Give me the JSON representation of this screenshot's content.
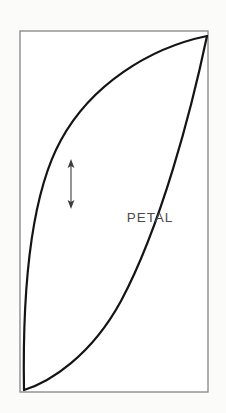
{
  "figure": {
    "background_color": "#fbfbfa",
    "ink_color": "#141414",
    "frame_color": "#8d8d8d",
    "label_color": "#4a4a4a",
    "canvas": {
      "width": 226,
      "height": 413
    }
  },
  "frame": {
    "name": "bounding-rectangle",
    "x": 20,
    "y": 31,
    "width": 188,
    "height": 361,
    "stroke_width": 1.4
  },
  "shape": {
    "name": "petal",
    "label": "PETAL",
    "label_x": 150,
    "label_y": 222,
    "stroke_width": 2.2,
    "tip_top_right": [
      207,
      36
    ],
    "tip_bottom_left": [
      24,
      390
    ],
    "upper_edge_path": "M 24 390 C 23 300 30 196 62 140 C 92 86 150 48 207 36",
    "lower_edge_path": "M 207 36 C 190 110 160 225 120 300 C 90 355 50 382 24 390"
  },
  "arrow": {
    "name": "grain-direction-arrow",
    "x": 71,
    "y_top": 160,
    "y_bottom": 208,
    "head_width": 5,
    "head_length": 8,
    "stroke_width": 1.1,
    "color": "#3c3c3c",
    "double_headed": true
  }
}
